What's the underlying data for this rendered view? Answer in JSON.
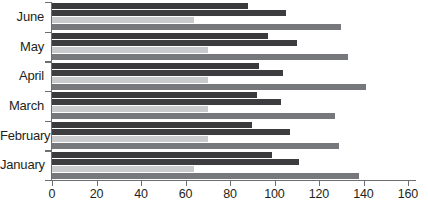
{
  "chart_data": {
    "type": "bar",
    "orientation": "horizontal",
    "title": "",
    "xlabel": "",
    "ylabel": "",
    "xlim": [
      0,
      160
    ],
    "grid": false,
    "legend": "none",
    "xticks": [
      0,
      20,
      40,
      60,
      80,
      100,
      120,
      140,
      160
    ],
    "xtick_labels": [
      "0",
      "20",
      "40",
      "60",
      "80",
      "100",
      "120",
      "140",
      "160"
    ],
    "categories": [
      "June",
      "May",
      "April",
      "March",
      "February",
      "January"
    ],
    "series": [
      {
        "name": "Series 1",
        "color": "#3a3a3c",
        "values": [
          88,
          97,
          93,
          92,
          90,
          99
        ]
      },
      {
        "name": "Series 2",
        "color": "#3d3d3f",
        "values": [
          105,
          110,
          104,
          103,
          107,
          111
        ]
      },
      {
        "name": "Series 3",
        "color": "#c9cacb",
        "values": [
          64,
          70,
          70,
          70,
          70,
          64
        ]
      },
      {
        "name": "Series 4",
        "color": "#77787b",
        "values": [
          130,
          133,
          141,
          127,
          129,
          138
        ]
      }
    ]
  }
}
